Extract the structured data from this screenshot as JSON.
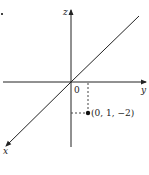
{
  "diagram": {
    "type": "3d-coordinate-axes",
    "axes": {
      "x_label": "x",
      "y_label": "y",
      "z_label": "z"
    },
    "origin_label": "0",
    "point": {
      "coords": [
        0,
        1,
        -2
      ],
      "label": "(0, 1, −2)"
    },
    "colors": {
      "ink": "#222222",
      "background": "#ffffff"
    }
  }
}
